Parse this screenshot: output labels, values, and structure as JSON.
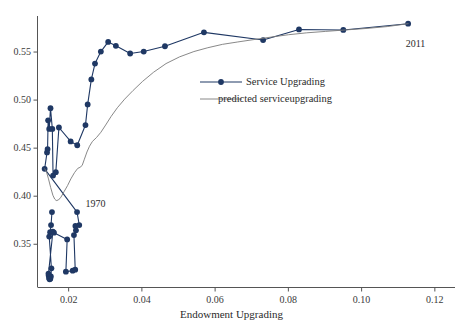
{
  "chart_data": {
    "type": "line",
    "title": "",
    "subtitle": "",
    "xlabel": "Endowment Upgrading",
    "ylabel": "",
    "xlim": [
      0.0115,
      0.1255
    ],
    "ylim": [
      0.305,
      0.5875
    ],
    "grid": false,
    "legend_position": "center-right-upper",
    "xticks": [
      "0.02",
      "0.04",
      "0.06",
      "0.08",
      "0.10",
      "0.12"
    ],
    "xtick_values": [
      0.02,
      0.04,
      0.06,
      0.08,
      0.1,
      0.12
    ],
    "yticks": [
      "0.35",
      "0.40",
      "0.45",
      "0.50",
      "0.55"
    ],
    "ytick_values": [
      0.35,
      0.4,
      0.45,
      0.5,
      0.55
    ],
    "annotations": [
      {
        "text": "1970",
        "x": 0.0235,
        "y": 0.3855
      },
      {
        "text": "2011",
        "x": 0.1115,
        "y": 0.5665
      }
    ],
    "series": [
      {
        "name": "Service Upgrading",
        "type": "line-marker",
        "color": "#1f3864",
        "marker": "circle",
        "points": [
          [
            0.01545,
            0.3835
          ],
          [
            0.0152,
            0.37
          ],
          [
            0.01495,
            0.3625
          ],
          [
            0.0147,
            0.358
          ],
          [
            0.0153,
            0.325
          ],
          [
            0.01515,
            0.3165
          ],
          [
            0.015,
            0.314
          ],
          [
            0.0148,
            0.3135
          ],
          [
            0.01465,
            0.315
          ],
          [
            0.01455,
            0.3175
          ],
          [
            0.0145,
            0.3195
          ],
          [
            0.0157,
            0.363
          ],
          [
            0.016,
            0.362
          ],
          [
            0.0196,
            0.355
          ],
          [
            0.01925,
            0.3215
          ],
          [
            0.0211,
            0.3225
          ],
          [
            0.0218,
            0.3235
          ],
          [
            0.02145,
            0.3595
          ],
          [
            0.022,
            0.3645
          ],
          [
            0.02185,
            0.369
          ],
          [
            0.0229,
            0.37
          ],
          [
            0.0223,
            0.3835
          ],
          [
            0.01345,
            0.4285
          ],
          [
            0.0141,
            0.4455
          ],
          [
            0.01425,
            0.449
          ],
          [
            0.0144,
            0.479
          ],
          [
            0.0147,
            0.47
          ],
          [
            0.01505,
            0.4915
          ],
          [
            0.01555,
            0.47
          ],
          [
            0.01575,
            0.4215
          ],
          [
            0.0165,
            0.425
          ],
          [
            0.01735,
            0.4715
          ],
          [
            0.02055,
            0.457
          ],
          [
            0.02235,
            0.453
          ],
          [
            0.0246,
            0.474
          ],
          [
            0.0252,
            0.4955
          ],
          [
            0.0262,
            0.5215
          ],
          [
            0.0272,
            0.538
          ],
          [
            0.0288,
            0.5505
          ],
          [
            0.0308,
            0.5605
          ],
          [
            0.0329,
            0.5565
          ],
          [
            0.0368,
            0.5485
          ],
          [
            0.0405,
            0.5505
          ],
          [
            0.0463,
            0.556
          ],
          [
            0.05695,
            0.5705
          ],
          [
            0.0731,
            0.5625
          ],
          [
            0.0829,
            0.5735
          ],
          [
            0.095,
            0.573
          ],
          [
            0.1127,
            0.5795
          ]
        ]
      },
      {
        "name": "predicted serviceupgrading",
        "type": "line",
        "color": "#7a7a7a",
        "marker": "none",
        "points": [
          [
            0.01345,
            0.4285
          ],
          [
            0.0139,
            0.426
          ],
          [
            0.0145,
            0.418
          ],
          [
            0.0151,
            0.409
          ],
          [
            0.0157,
            0.401
          ],
          [
            0.0162,
            0.397
          ],
          [
            0.0166,
            0.3955
          ],
          [
            0.0172,
            0.396
          ],
          [
            0.0179,
            0.399
          ],
          [
            0.0188,
            0.405
          ],
          [
            0.0197,
            0.411
          ],
          [
            0.0206,
            0.418
          ],
          [
            0.0216,
            0.4245
          ],
          [
            0.0225,
            0.429
          ],
          [
            0.0231,
            0.43
          ],
          [
            0.0237,
            0.432
          ],
          [
            0.0243,
            0.4385
          ],
          [
            0.025,
            0.446
          ],
          [
            0.0257,
            0.452
          ],
          [
            0.0265,
            0.457
          ],
          [
            0.0276,
            0.461
          ],
          [
            0.0288,
            0.4665
          ],
          [
            0.0301,
            0.474
          ],
          [
            0.0316,
            0.483
          ],
          [
            0.0333,
            0.492
          ],
          [
            0.0353,
            0.501
          ],
          [
            0.0376,
            0.51
          ],
          [
            0.0402,
            0.5195
          ],
          [
            0.0432,
            0.529
          ],
          [
            0.0466,
            0.538
          ],
          [
            0.0503,
            0.545
          ],
          [
            0.0542,
            0.5505
          ],
          [
            0.058,
            0.5545
          ],
          [
            0.062,
            0.558
          ],
          [
            0.0662,
            0.5605
          ],
          [
            0.0706,
            0.563
          ],
          [
            0.0752,
            0.5655
          ],
          [
            0.08,
            0.568
          ],
          [
            0.085,
            0.57
          ],
          [
            0.0902,
            0.5715
          ],
          [
            0.0956,
            0.573
          ],
          [
            0.1012,
            0.5745
          ],
          [
            0.107,
            0.5765
          ],
          [
            0.1127,
            0.5795
          ]
        ]
      }
    ]
  },
  "legend": {
    "items": [
      {
        "label": "Service Upgrading",
        "color": "#1f3864",
        "marker": "circle"
      },
      {
        "label": "predicted serviceupgrading",
        "color": "#7a7a7a",
        "marker": "none"
      }
    ]
  }
}
